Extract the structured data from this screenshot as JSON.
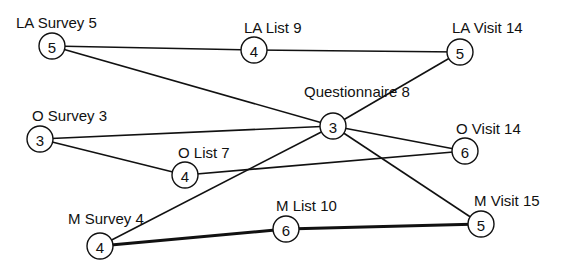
{
  "diagram": {
    "type": "network-graph",
    "nodes": [
      {
        "id": "la_survey",
        "label": "LA Survey 5",
        "value": "5",
        "cx": 52,
        "cy": 46,
        "lx": 16,
        "ly": 28
      },
      {
        "id": "la_list",
        "label": "LA List 9",
        "value": "4",
        "cx": 254,
        "cy": 50,
        "lx": 244,
        "ly": 33
      },
      {
        "id": "la_visit",
        "label": "LA Visit 14",
        "value": "5",
        "cx": 460,
        "cy": 52,
        "lx": 452,
        "ly": 33
      },
      {
        "id": "questionnaire",
        "label": "Questionnaire 8",
        "value": "3",
        "cx": 333,
        "cy": 126,
        "lx": 304,
        "ly": 97
      },
      {
        "id": "o_survey",
        "label": "O Survey 3",
        "value": "3",
        "cx": 40,
        "cy": 139,
        "lx": 32,
        "ly": 121
      },
      {
        "id": "o_list",
        "label": "O List 7",
        "value": "4",
        "cx": 185,
        "cy": 175,
        "lx": 178,
        "ly": 158
      },
      {
        "id": "o_visit",
        "label": "O Visit 14",
        "value": "6",
        "cx": 465,
        "cy": 151,
        "lx": 456,
        "ly": 134
      },
      {
        "id": "m_survey",
        "label": "M Survey 4",
        "value": "4",
        "cx": 100,
        "cy": 246,
        "lx": 68,
        "ly": 224
      },
      {
        "id": "m_list",
        "label": "M List 10",
        "value": "6",
        "cx": 286,
        "cy": 229,
        "lx": 276,
        "ly": 211
      },
      {
        "id": "m_visit",
        "label": "M Visit 15",
        "value": "5",
        "cx": 481,
        "cy": 224,
        "lx": 474,
        "ly": 206
      }
    ],
    "edges": [
      {
        "from": "la_survey",
        "to": "la_list",
        "weight": "normal"
      },
      {
        "from": "la_list",
        "to": "la_visit",
        "weight": "normal"
      },
      {
        "from": "la_survey",
        "to": "questionnaire",
        "weight": "normal"
      },
      {
        "from": "questionnaire",
        "to": "la_visit",
        "weight": "normal"
      },
      {
        "from": "o_survey",
        "to": "questionnaire",
        "weight": "normal"
      },
      {
        "from": "o_survey",
        "to": "o_list",
        "weight": "normal"
      },
      {
        "from": "o_list",
        "to": "o_visit",
        "weight": "normal"
      },
      {
        "from": "questionnaire",
        "to": "o_visit",
        "weight": "normal"
      },
      {
        "from": "questionnaire",
        "to": "m_visit",
        "weight": "normal"
      },
      {
        "from": "m_survey",
        "to": "questionnaire",
        "weight": "normal"
      },
      {
        "from": "m_survey",
        "to": "m_list",
        "weight": "bold"
      },
      {
        "from": "m_list",
        "to": "m_visit",
        "weight": "bold"
      }
    ],
    "node_radius": 13
  }
}
